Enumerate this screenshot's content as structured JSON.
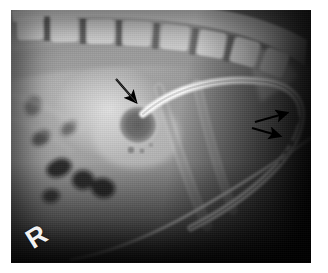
{
  "figure": {
    "modality": "radiograph",
    "view_label": "lateral cervical radiograph",
    "frame_color": "#ffffff",
    "plate_background": "#050505"
  },
  "markers": {
    "side_marker": "R",
    "side_marker_meaning": "right-side radiographic marker"
  },
  "annotations": [
    {
      "id": "arrow-1",
      "name": "arrow-pointing-to-round-lucency",
      "direction": "down-right",
      "tip_x": 137,
      "tip_y": 103,
      "tail_x": 116,
      "tail_y": 79,
      "target": "round gas-filled lucency with soft-tissue halo"
    },
    {
      "id": "arrow-2",
      "name": "arrow-pointing-to-upper-tube-marker",
      "direction": "right",
      "tip_x": 288,
      "tip_y": 113,
      "tail_x": 255,
      "tail_y": 122,
      "target": "proximal radiopaque tube marker"
    },
    {
      "id": "arrow-3",
      "name": "arrow-pointing-to-lower-tube-marker",
      "direction": "right",
      "tip_x": 281,
      "tip_y": 135,
      "tail_x": 252,
      "tail_y": 128,
      "target": "distal radiopaque tube fenestrations"
    }
  ],
  "anatomy": {
    "spine_label": "cervical vertebral column",
    "vertebral_body_count": 7,
    "soft_tissue_label": "pharyngeal and cervical soft tissue",
    "gas_lucency_label": "gas-filled pharyngeal lumen",
    "round_lesion_label": "round radiolucent structure"
  },
  "devices": {
    "primary_tube_label": "radiopaque curved tube",
    "secondary_tube_label": "second radiolucent tube",
    "thin_wire_label": "thin radiopaque line",
    "tube_markers_count": 4
  },
  "palette": {
    "bone_bright": "#e8e8e8",
    "tube_bright": "#f5f5f5",
    "soft_tissue_mid": "#8c8c8c",
    "gas_dark": "#1a1a1a",
    "background_black": "#050505",
    "arrow_black": "#000000",
    "marker_white": "#f2f2f2"
  }
}
